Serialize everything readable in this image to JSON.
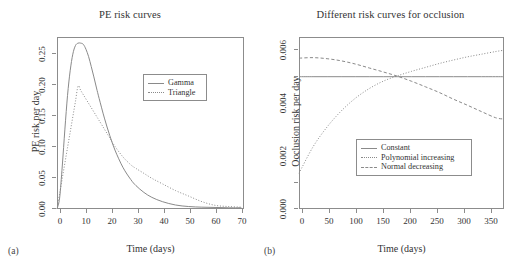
{
  "figure": {
    "panels": [
      {
        "sublabel": "(a)",
        "title": "PE risk curves",
        "xlabel": "Time (days)",
        "ylabel": "PE risk per day",
        "xticks": [
          "0",
          "10",
          "20",
          "30",
          "40",
          "50",
          "60",
          "70"
        ],
        "yticks": [
          "0.00",
          "0.05",
          "0.10",
          "0.15",
          "0.20",
          "0.25"
        ],
        "legend": [
          {
            "label": "Gamma",
            "style": "solid"
          },
          {
            "label": "Triangle",
            "style": "dotted"
          }
        ]
      },
      {
        "sublabel": "(b)",
        "title": "Different risk curves for occlusion",
        "xlabel": "Time (days)",
        "ylabel": "Occlusion risk per day",
        "xticks": [
          "0",
          "50",
          "100",
          "150",
          "200",
          "250",
          "300",
          "350"
        ],
        "yticks": [
          "0.000",
          "0.002",
          "0.004",
          "0.006"
        ],
        "legend": [
          {
            "label": "Constant",
            "style": "solid"
          },
          {
            "label": "Polynomial increasing",
            "style": "dotted"
          },
          {
            "label": "Normal decreasing",
            "style": "dashed"
          }
        ]
      }
    ]
  },
  "colors": {
    "line": "#8a8a8a",
    "axis": "#8c8c8c",
    "text": "#333333",
    "background": "#ffffff"
  },
  "chart_data": [
    {
      "type": "line",
      "title": "PE risk curves",
      "xlabel": "Time (days)",
      "ylabel": "PE risk per day",
      "xlim": [
        0,
        71
      ],
      "ylim": [
        0,
        0.28
      ],
      "xticks": [
        0,
        10,
        20,
        30,
        40,
        50,
        60,
        70
      ],
      "yticks": [
        0.0,
        0.05,
        0.1,
        0.15,
        0.2,
        0.25
      ],
      "grid": false,
      "legend_position": "upper-right-inset",
      "x": [
        0,
        1,
        2,
        3,
        4,
        5,
        6,
        7,
        8,
        9,
        10,
        11,
        12,
        13,
        14,
        15,
        16,
        18,
        20,
        22,
        25,
        28,
        30,
        33,
        36,
        40,
        45,
        50,
        55,
        60,
        65,
        70
      ],
      "series": [
        {
          "name": "Gamma",
          "style": "solid",
          "values": [
            0.0,
            0.018,
            0.07,
            0.13,
            0.185,
            0.225,
            0.252,
            0.266,
            0.27,
            0.27,
            0.268,
            0.26,
            0.248,
            0.232,
            0.215,
            0.197,
            0.18,
            0.148,
            0.12,
            0.096,
            0.068,
            0.048,
            0.038,
            0.027,
            0.019,
            0.012,
            0.0065,
            0.004,
            0.003,
            0.0025,
            0.002,
            0.002
          ]
        },
        {
          "name": "Triangle",
          "style": "dotted",
          "values": [
            0.0,
            0.025,
            0.05,
            0.075,
            0.1,
            0.125,
            0.15,
            0.175,
            0.2,
            0.193,
            0.186,
            0.179,
            0.172,
            0.165,
            0.158,
            0.151,
            0.144,
            0.13,
            0.116,
            0.102,
            0.085,
            0.072,
            0.066,
            0.058,
            0.05,
            0.041,
            0.03,
            0.021,
            0.012,
            0.006,
            0.004,
            0.003
          ]
        }
      ]
    },
    {
      "type": "line",
      "title": "Different risk curves for occlusion",
      "xlabel": "Time (days)",
      "ylabel": "Occlusion risk per day",
      "xlim": [
        0,
        365
      ],
      "ylim": [
        0,
        0.0065
      ],
      "xticks": [
        0,
        50,
        100,
        150,
        200,
        250,
        300,
        350
      ],
      "yticks": [
        0.0,
        0.002,
        0.004,
        0.006
      ],
      "grid": false,
      "legend_position": "lower-right-inset",
      "x": [
        0,
        25,
        50,
        75,
        100,
        125,
        150,
        175,
        200,
        225,
        250,
        275,
        300,
        325,
        350,
        365
      ],
      "series": [
        {
          "name": "Constant",
          "style": "solid",
          "values": [
            0.005,
            0.005,
            0.005,
            0.005,
            0.005,
            0.005,
            0.005,
            0.005,
            0.005,
            0.005,
            0.005,
            0.005,
            0.005,
            0.005,
            0.005,
            0.005
          ]
        },
        {
          "name": "Polynomial increasing",
          "style": "dotted",
          "values": [
            0.00135,
            0.00235,
            0.0031,
            0.0037,
            0.00418,
            0.00455,
            0.00483,
            0.00503,
            0.0052,
            0.00535,
            0.0055,
            0.00563,
            0.00575,
            0.00585,
            0.00595,
            0.006
          ]
        },
        {
          "name": "Normal decreasing",
          "style": "dashed",
          "values": [
            0.0057,
            0.00572,
            0.00568,
            0.0056,
            0.00548,
            0.00533,
            0.00518,
            0.00502,
            0.00483,
            0.00462,
            0.0044,
            0.00415,
            0.00392,
            0.00368,
            0.00345,
            0.0034
          ]
        }
      ]
    }
  ]
}
